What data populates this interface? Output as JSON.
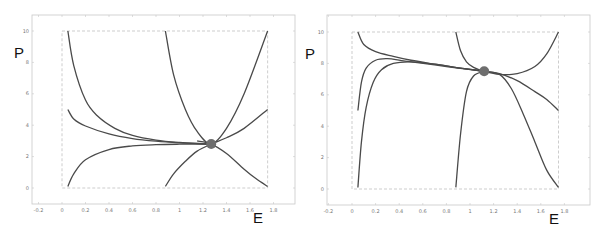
{
  "chart_data": [
    {
      "type": "line",
      "title": "",
      "xlabel": "E",
      "ylabel": "P",
      "xlim": [
        -0.25,
        2.0
      ],
      "ylim": [
        -1,
        11
      ],
      "xticks": [
        "-0.2",
        "0",
        "0.2",
        "0.4",
        "0.6",
        "0.8",
        "1",
        "1.2",
        "1.4",
        "1.6",
        "1.8"
      ],
      "yticks": [
        "0",
        "2",
        "4",
        "6",
        "8",
        "10"
      ],
      "plot_box": {
        "xmin": 0,
        "xmax": 1.75,
        "ymin": 0,
        "ymax": 10,
        "style": "dashed"
      },
      "grid": false,
      "equilibrium_point": {
        "E": 1.27,
        "P": 2.8
      },
      "series": [
        {
          "name": "trajectory-1",
          "x": [
            0.05,
            0.1,
            0.2,
            0.3,
            0.45,
            0.6,
            0.8,
            1.0,
            1.2,
            1.27
          ],
          "y": [
            10,
            7.8,
            5.6,
            4.6,
            3.8,
            3.35,
            3.05,
            2.9,
            2.82,
            2.8
          ]
        },
        {
          "name": "trajectory-2",
          "x": [
            0.05,
            0.1,
            0.2,
            0.4,
            0.6,
            0.8,
            1.0,
            1.2,
            1.27
          ],
          "y": [
            5.0,
            4.4,
            3.95,
            3.45,
            3.15,
            2.98,
            2.88,
            2.82,
            2.8
          ]
        },
        {
          "name": "trajectory-3",
          "x": [
            0.05,
            0.1,
            0.2,
            0.4,
            0.6,
            0.8,
            1.0,
            1.2,
            1.27
          ],
          "y": [
            0.1,
            0.9,
            1.8,
            2.45,
            2.68,
            2.76,
            2.79,
            2.8,
            2.8
          ]
        },
        {
          "name": "trajectory-4",
          "x": [
            0.88,
            0.95,
            1.05,
            1.15,
            1.27,
            1.4,
            1.55,
            1.75
          ],
          "y": [
            10,
            7.2,
            5.0,
            3.6,
            2.8,
            3.8,
            6.0,
            10.0
          ]
        },
        {
          "name": "trajectory-5",
          "x": [
            0.88,
            0.95,
            1.05,
            1.15,
            1.27,
            1.4,
            1.55,
            1.75
          ],
          "y": [
            0.1,
            0.9,
            1.7,
            2.35,
            2.8,
            3.2,
            3.8,
            5.0
          ]
        },
        {
          "name": "trajectory-6",
          "x": [
            1.15,
            1.27,
            1.4,
            1.55,
            1.65,
            1.75
          ],
          "y": [
            3.0,
            2.8,
            2.2,
            1.2,
            0.6,
            0.1
          ]
        }
      ]
    },
    {
      "type": "line",
      "title": "",
      "xlabel": "E",
      "ylabel": "P",
      "xlim": [
        -0.25,
        2.0
      ],
      "ylim": [
        -1,
        11
      ],
      "xticks": [
        "-0.2",
        "0",
        "0.2",
        "0.4",
        "0.6",
        "0.8",
        "1",
        "1.2",
        "1.4",
        "1.6",
        "1.8"
      ],
      "yticks": [
        "0",
        "2",
        "4",
        "6",
        "8",
        "10"
      ],
      "plot_box": {
        "xmin": 0,
        "xmax": 1.75,
        "ymin": 0,
        "ymax": 10,
        "style": "dashed"
      },
      "grid": false,
      "equilibrium_point": {
        "E": 1.12,
        "P": 7.5
      },
      "series": [
        {
          "name": "trajectory-1",
          "x": [
            0.05,
            0.1,
            0.2,
            0.35,
            0.5,
            0.7,
            0.9,
            1.12
          ],
          "y": [
            10,
            9.2,
            8.75,
            8.45,
            8.2,
            7.95,
            7.72,
            7.5
          ]
        },
        {
          "name": "trajectory-2",
          "x": [
            0.05,
            0.08,
            0.12,
            0.2,
            0.3,
            0.45,
            0.7,
            0.9,
            1.12
          ],
          "y": [
            5.0,
            6.8,
            7.7,
            8.2,
            8.3,
            8.15,
            7.9,
            7.7,
            7.5
          ]
        },
        {
          "name": "trajectory-3",
          "x": [
            0.05,
            0.08,
            0.12,
            0.18,
            0.25,
            0.35,
            0.5,
            0.7,
            0.9,
            1.12
          ],
          "y": [
            0.1,
            3.0,
            5.2,
            6.8,
            7.6,
            8.0,
            8.1,
            7.95,
            7.72,
            7.5
          ]
        },
        {
          "name": "trajectory-4",
          "x": [
            0.88,
            0.92,
            0.97,
            1.03,
            1.12,
            1.25,
            1.4,
            1.55,
            1.65,
            1.75
          ],
          "y": [
            10,
            8.8,
            8.1,
            7.75,
            7.5,
            7.3,
            7.35,
            7.8,
            8.6,
            10.0
          ]
        },
        {
          "name": "trajectory-5",
          "x": [
            0.88,
            0.92,
            0.97,
            1.03,
            1.12
          ],
          "y": [
            0.1,
            3.5,
            6.2,
            7.2,
            7.5
          ]
        },
        {
          "name": "trajectory-6",
          "x": [
            1.12,
            1.25,
            1.4,
            1.55,
            1.65,
            1.75
          ],
          "y": [
            7.5,
            7.35,
            6.9,
            6.2,
            5.7,
            5.0
          ]
        },
        {
          "name": "trajectory-7",
          "x": [
            1.12,
            1.25,
            1.35,
            1.45,
            1.55,
            1.65,
            1.75
          ],
          "y": [
            7.5,
            7.3,
            6.4,
            4.8,
            3.0,
            1.2,
            0.1
          ]
        }
      ]
    }
  ],
  "labels": {
    "left_ylabel": "P",
    "left_xlabel": "E",
    "right_ylabel": "P",
    "right_xlabel": "E"
  },
  "style": {
    "curve_color": "#4a4a4a",
    "point_color": "#6e6e6e",
    "frame_color": "#c8c8c8",
    "box_color": "#b8b8b8"
  }
}
